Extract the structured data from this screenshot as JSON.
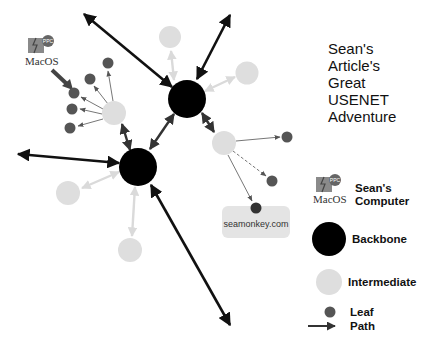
{
  "title": {
    "lines": [
      "Sean's",
      "Article's",
      "Great",
      "USENET",
      "Adventure"
    ]
  },
  "icon": {
    "macos_label": "MacOS",
    "ppc_badge": "PPC"
  },
  "server_box": {
    "label": "seamonkey.com"
  },
  "legend": {
    "items": [
      {
        "label_line1": "Sean's",
        "label_line2": "Computer",
        "symbol": "macos-icon"
      },
      {
        "label": "Backbone",
        "symbol": "black-circle"
      },
      {
        "label": "Intermediate",
        "symbol": "light-gray-circle"
      },
      {
        "label": "Leaf",
        "symbol": "dark-gray-circle"
      },
      {
        "label": "Path",
        "symbol": "arrow"
      }
    ]
  },
  "colors": {
    "backbone": "#000000",
    "intermediate": "#dedede",
    "leaf": "#555555",
    "path": "#1a1a1a",
    "server_box": "#e4e4e4"
  }
}
